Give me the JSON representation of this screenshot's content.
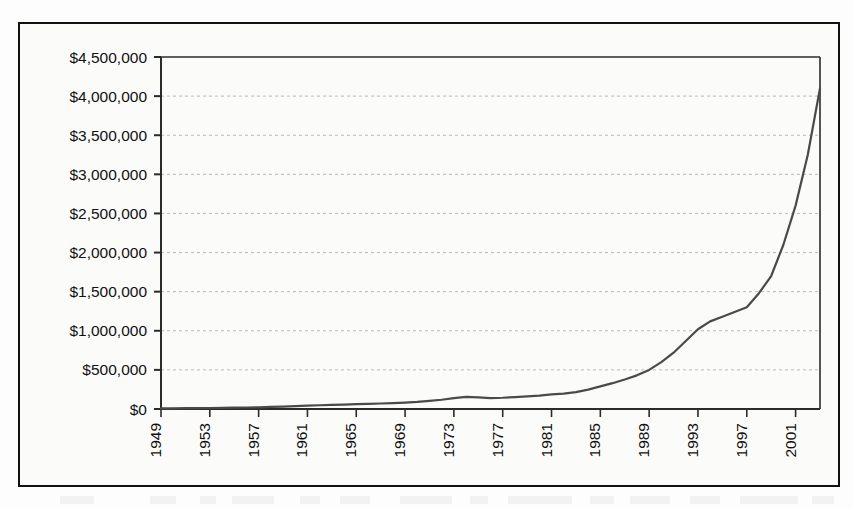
{
  "figure": {
    "background_color": "#fbfbfa",
    "frame_color": "#111111",
    "line_color": "#4a4a4a",
    "gridline_color": "#b9b9b9",
    "axis_color": "#2b2b2b"
  },
  "chart_data": {
    "type": "line",
    "title": "",
    "subtitle": "",
    "xlabel": "",
    "ylabel": "",
    "grid": true,
    "legend": false,
    "legend_position": "none",
    "xlim": [
      1949,
      2003
    ],
    "ylim": [
      0,
      4500000
    ],
    "y_tick_step": 500000,
    "x_tick_step": 4,
    "x_tick_label_rotation": -90,
    "y_tick_labels": [
      "$4,500,000",
      "$4,000,000",
      "$3,500,000",
      "$3,000,000",
      "$2,500,000",
      "$2,000,000",
      "$1,500,000",
      "$1,000,000",
      "$500,000",
      "$0"
    ],
    "y_tick_values": [
      4500000,
      4000000,
      3500000,
      3000000,
      2500000,
      2000000,
      1500000,
      1000000,
      500000,
      0
    ],
    "x_tick_labels": [
      "1949",
      "1953",
      "1957",
      "1961",
      "1965",
      "1969",
      "1973",
      "1977",
      "1981",
      "1985",
      "1989",
      "1993",
      "1997",
      "2001"
    ],
    "x_tick_values": [
      1949,
      1953,
      1957,
      1961,
      1965,
      1969,
      1973,
      1977,
      1981,
      1985,
      1989,
      1993,
      1997,
      2001
    ],
    "series": [
      {
        "name": "value",
        "x": [
          1949,
          1950,
          1951,
          1952,
          1953,
          1954,
          1955,
          1956,
          1957,
          1958,
          1959,
          1960,
          1961,
          1962,
          1963,
          1964,
          1965,
          1966,
          1967,
          1968,
          1969,
          1970,
          1971,
          1972,
          1973,
          1974,
          1975,
          1976,
          1977,
          1978,
          1979,
          1980,
          1981,
          1982,
          1983,
          1984,
          1985,
          1986,
          1987,
          1988,
          1989,
          1990,
          1991,
          1992,
          1993,
          1994,
          1995,
          1996,
          1997,
          1998,
          1999,
          2000,
          2001,
          2002,
          2003
        ],
        "values": [
          8000,
          9000,
          10000,
          12000,
          13000,
          15000,
          17000,
          19000,
          22000,
          26000,
          30000,
          36000,
          44000,
          48000,
          52000,
          57000,
          62000,
          66000,
          70000,
          76000,
          82000,
          90000,
          104000,
          118000,
          140000,
          156000,
          148000,
          140000,
          144000,
          152000,
          162000,
          172000,
          186000,
          196000,
          216000,
          248000,
          290000,
          330000,
          378000,
          430000,
          500000,
          600000,
          720000,
          870000,
          1020000,
          1120000,
          1180000,
          1240000,
          1300000,
          1480000,
          1700000,
          2100000,
          2600000,
          3250000,
          4100000
        ]
      }
    ]
  }
}
